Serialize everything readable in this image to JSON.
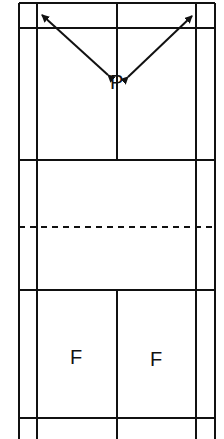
{
  "diagram": {
    "players": [
      {
        "id": "P",
        "label": "P",
        "x": 118,
        "y": 82
      },
      {
        "id": "F1",
        "label": "F",
        "x": 77,
        "y": 357
      },
      {
        "id": "F2",
        "label": "F",
        "x": 157,
        "y": 359
      }
    ],
    "arrows": [
      {
        "from": "P",
        "to": "top-left-corner"
      },
      {
        "from": "P",
        "to": "top-right-corner"
      }
    ],
    "court_lines": {
      "outer_left": 19,
      "inner_left": 37,
      "center": 117,
      "inner_right": 196,
      "outer_right": 215,
      "top": 3,
      "back_service_top": 28,
      "short_service_top": 160,
      "net": 227,
      "short_service_bottom": 290,
      "back_service_bottom": 418
    },
    "colors": {
      "line": "#111111",
      "background": "#ffffff"
    }
  }
}
